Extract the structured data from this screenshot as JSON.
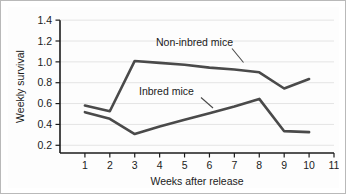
{
  "chart_data": {
    "type": "line",
    "title": "",
    "xlabel": "Weeks after release",
    "ylabel": "Weekly survival",
    "xlim": [
      0,
      11
    ],
    "ylim": [
      0,
      1.4
    ],
    "grid": true,
    "legend_position": "inline-annotations",
    "x": [
      1,
      2,
      3,
      4,
      5,
      6,
      7,
      8,
      9,
      10
    ],
    "xticks": [
      "1",
      "2",
      "3",
      "4",
      "5",
      "6",
      "7",
      "8",
      "9",
      "10",
      "11"
    ],
    "xtick_values": [
      1,
      2,
      3,
      4,
      5,
      6,
      7,
      8,
      9,
      10,
      11
    ],
    "yticks": [
      "0.2",
      "0.4",
      "0.6",
      "0.8",
      "1.0",
      "1.2",
      "1.4"
    ],
    "ytick_values": [
      0.2,
      0.4,
      0.6,
      0.8,
      1.0,
      1.2,
      1.4
    ],
    "series": [
      {
        "name": "Non-inbred mice",
        "values": [
          0.5,
          0.44,
          0.97,
          0.95,
          0.93,
          0.9,
          0.88,
          0.85,
          0.68,
          0.78
        ],
        "color": "#4a4a4a"
      },
      {
        "name": "Inbred mice",
        "values": [
          0.43,
          0.36,
          0.2,
          0.28,
          0.35,
          0.42,
          0.49,
          0.57,
          0.23,
          0.22
        ],
        "color": "#4a4a4a"
      }
    ],
    "annotations": [
      {
        "text": "Non-inbred mice",
        "x": 4.55,
        "y": 1.14
      },
      {
        "text": "Inbred mice",
        "x": 4.3,
        "y": 0.61
      }
    ]
  }
}
